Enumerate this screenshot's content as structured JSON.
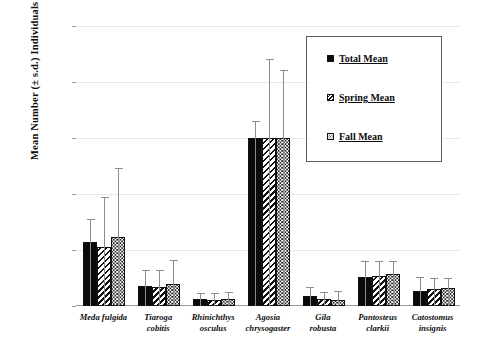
{
  "chart_data": {
    "type": "bar",
    "title": "",
    "xlabel": "",
    "ylabel": "Mean Number (± s.d.) Individuals (2002-17)",
    "ylim": [
      0,
      2500
    ],
    "yticks": [
      0,
      500,
      1000,
      1500,
      2000,
      2500
    ],
    "ytick_labels": [
      "0",
      "500",
      "1000",
      "1500",
      "2000",
      "2500"
    ],
    "grid": true,
    "legend_position": "upper-right-inset",
    "categories": [
      "Meda fulgida",
      "Tiaroga cobitis",
      "Rhinichthys osculus",
      "Agosia chrysogaster",
      "Gila robusta",
      "Pantosteus clarkii",
      "Catostomus insignis"
    ],
    "category_lines": [
      [
        "Meda fulgida"
      ],
      [
        "Tiaroga",
        "cobitis"
      ],
      [
        "Rhinichthys",
        "osculus"
      ],
      [
        "Agosia",
        "chrysogaster"
      ],
      [
        "Gila",
        "robusta"
      ],
      [
        "Pantosteus",
        "clarkii"
      ],
      [
        "Catostomus",
        "insignis"
      ]
    ],
    "series": [
      {
        "name": "Total Mean",
        "pattern": "solid-black",
        "values": [
          575,
          175,
          60,
          1500,
          85,
          260,
          130
        ],
        "errors": [
          195,
          135,
          50,
          140,
          75,
          130,
          120
        ]
      },
      {
        "name": "Spring Mean",
        "pattern": "diagonal-hatch",
        "values": [
          525,
          170,
          55,
          1500,
          60,
          270,
          150
        ],
        "errors": [
          435,
          140,
          55,
          695,
          60,
          125,
          95
        ]
      },
      {
        "name": "Fall Mean",
        "pattern": "dotted",
        "values": [
          620,
          200,
          65,
          1500,
          55,
          290,
          165
        ],
        "errors": [
          600,
          200,
          55,
          600,
          70,
          100,
          80
        ]
      }
    ]
  },
  "legend": {
    "items": [
      {
        "label": "Total Mean",
        "swatch": "total"
      },
      {
        "label": "Spring  Mean",
        "swatch": "spring"
      },
      {
        "label": "Fall Mean",
        "swatch": "fall"
      }
    ]
  },
  "colors": {
    "total": "#0a0a0a",
    "hatch": "#111111",
    "dots": "#2a2a2a",
    "gridline": "#e9e9e9",
    "axis": "#9a9a9a",
    "errorbar": "#8d8d8d",
    "text": "#0d0d0d"
  }
}
